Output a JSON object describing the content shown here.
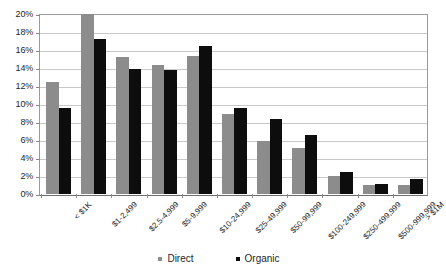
{
  "chart_data": {
    "type": "bar",
    "title": "",
    "xlabel": "",
    "ylabel": "",
    "ylim": [
      0,
      20
    ],
    "ytick_labels": [
      "0%",
      "2%",
      "4%",
      "6%",
      "8%",
      "10%",
      "12%",
      "14%",
      "16%",
      "18%",
      "20%"
    ],
    "ytick_values": [
      0,
      2,
      4,
      6,
      8,
      10,
      12,
      14,
      16,
      18,
      20
    ],
    "grid": true,
    "legend_position": "bottom",
    "categories": [
      "< $1K",
      "$1-2,499",
      "$2.5-4,999",
      "$5-9,999",
      "$10-24,999",
      "$25-49,999",
      "$50-99,999",
      "$100-249,999",
      "$250-499,999",
      "$500-999,999",
      "> $1M"
    ],
    "series": [
      {
        "name": "Direct",
        "color": "#8c8c8c",
        "values": [
          12.5,
          20.0,
          15.2,
          14.3,
          15.3,
          8.9,
          5.9,
          5.1,
          2.0,
          1.0,
          1.0
        ]
      },
      {
        "name": "Organic",
        "color": "#0d0d0d",
        "values": [
          9.6,
          17.2,
          13.9,
          13.8,
          16.4,
          9.6,
          8.3,
          6.6,
          2.4,
          1.1,
          1.7
        ]
      }
    ]
  },
  "legend": {
    "items": [
      {
        "label": "Direct",
        "color": "#8c8c8c"
      },
      {
        "label": "Organic",
        "color": "#0d0d0d"
      }
    ]
  }
}
